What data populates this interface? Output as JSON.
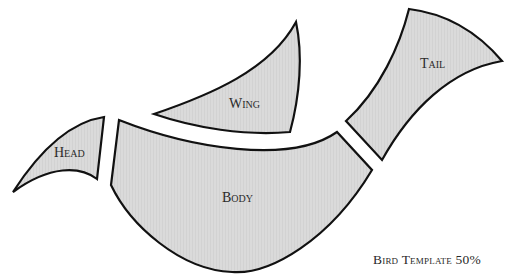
{
  "title": "Bird Template 50%",
  "pieces": {
    "head": {
      "label": "Head"
    },
    "wing": {
      "label": "Wing"
    },
    "body": {
      "label": "Body"
    },
    "tail": {
      "label": "Tail"
    }
  },
  "colors": {
    "piece_fill": "#d9d9d9",
    "outline": "#111111",
    "text": "#2a2a2a",
    "background": "#ffffff"
  }
}
